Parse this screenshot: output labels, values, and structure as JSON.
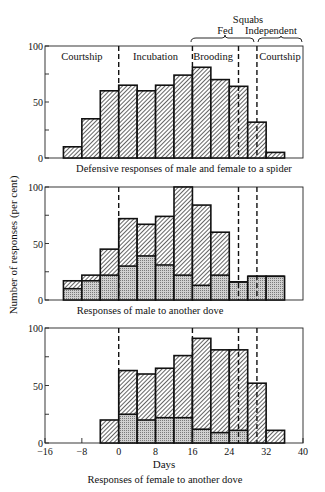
{
  "chart_data": [
    {
      "type": "bar",
      "panel": "top",
      "caption": "Defensive responses of male and female to a spider",
      "xlabel": "Days",
      "ylabel": "Number of responses (per cent)",
      "xlim": [
        -16,
        40
      ],
      "ylim": [
        0,
        100
      ],
      "yticks": [
        0,
        50,
        100
      ],
      "bin_width": 4,
      "bin_starts": [
        -12,
        -8,
        -4,
        0,
        4,
        8,
        12,
        16,
        20,
        24,
        28,
        32
      ],
      "series": [
        {
          "name": "Total (hatched)",
          "values": [
            10,
            35,
            60,
            65,
            60,
            65,
            74,
            81,
            70,
            64,
            32,
            5
          ]
        }
      ],
      "phase_labels": [
        {
          "text": "Courtship",
          "x": -8
        },
        {
          "text": "Incubation",
          "x": 8
        },
        {
          "text": "Brooding",
          "x": 20.5
        },
        {
          "text": "Courtship",
          "x": 35
        }
      ],
      "dashed_lines": [
        0,
        16,
        26,
        30
      ]
    },
    {
      "type": "bar",
      "panel": "middle",
      "caption": "Responses of male to another dove",
      "xlim": [
        -16,
        40
      ],
      "ylim": [
        0,
        100
      ],
      "yticks": [
        0,
        50,
        100
      ],
      "bin_width": 4,
      "bin_starts": [
        -12,
        -8,
        -4,
        0,
        4,
        8,
        12,
        16,
        20,
        24,
        28,
        32
      ],
      "series": [
        {
          "name": "Total (hatched)",
          "values": [
            17,
            22,
            45,
            72,
            67,
            74,
            100,
            84,
            60,
            16,
            21,
            21
          ]
        },
        {
          "name": "Stippled portion",
          "values": [
            10,
            17,
            22,
            30,
            39,
            31,
            22,
            13,
            22,
            16,
            21,
            21
          ]
        }
      ],
      "dashed_lines": [
        0,
        26,
        30
      ]
    },
    {
      "type": "bar",
      "panel": "bottom",
      "caption": "Responses of female to another dove",
      "xlim": [
        -16,
        40
      ],
      "ylim": [
        0,
        100
      ],
      "yticks": [
        0,
        50,
        100
      ],
      "xticks": [
        -16,
        -8,
        0,
        8,
        16,
        24,
        32,
        40
      ],
      "bin_width": 4,
      "bin_starts": [
        -4,
        0,
        4,
        8,
        12,
        16,
        20,
        24,
        28,
        32
      ],
      "series": [
        {
          "name": "Total (hatched)",
          "values": [
            20,
            63,
            60,
            65,
            76,
            91,
            81,
            81,
            52,
            11
          ]
        },
        {
          "name": "Stippled portion",
          "values": [
            0,
            25,
            20,
            22,
            22,
            12,
            9,
            11,
            0,
            0
          ]
        }
      ],
      "dashed_lines": [
        0,
        16,
        26,
        30
      ]
    }
  ],
  "header": {
    "squabs": "Squabs",
    "fed": "Fed",
    "independent": "Independent"
  },
  "axis": {
    "ylabel": "Number of responses (per cent)",
    "xlabel": "Days",
    "xtick_labels": [
      "−16",
      "−8",
      "0",
      "8",
      "16",
      "24",
      "32",
      "40"
    ],
    "ytick_labels": [
      "0",
      "50",
      "100"
    ]
  },
  "captions": {
    "top": "Defensive responses of male and female to a spider",
    "middle": "Responses of male to another dove",
    "bottom": "Responses of female to another dove"
  },
  "colors": {
    "ink": "#111111",
    "stipple": "#bdbdbd",
    "background": "#ffffff"
  }
}
